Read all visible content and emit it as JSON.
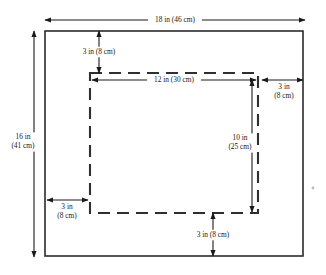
{
  "diagram": {
    "type": "technical-dimension-drawing",
    "units": {
      "primary": "in",
      "secondary": "cm"
    },
    "colors": {
      "background": "#ffffff",
      "outer_rect_stroke": "#2b2b2b",
      "dashed_rect_stroke": "#2f2f2f",
      "dimension_stroke": "#1a1a1a",
      "text": "#1a1a1a"
    },
    "outer_rect": {
      "name": "outer-sheet",
      "x": 45,
      "y": 31,
      "width": 258,
      "height": 225,
      "width_label": "18 in (46 cm)",
      "height_label_line1": "16 in",
      "height_label_line2": "(41 cm)"
    },
    "inner_rect": {
      "name": "inner-dashed-region",
      "x": 90,
      "y": 73,
      "width": 168,
      "height": 140,
      "width_label": "12 in (30 cm)",
      "height_label_line1": "10 in",
      "height_label_line2": "(25 cm)",
      "dash_on": 12,
      "dash_off": 7
    },
    "dimensions": [
      {
        "id": "overall-width",
        "label": "18 in (46 cm)",
        "lines": [
          "18 in (46 cm)"
        ],
        "orientation": "horizontal",
        "x1": 45,
        "y1": 20,
        "x2": 305,
        "y2": 20,
        "text_x": 175,
        "text_y": 20,
        "arrows": "both"
      },
      {
        "id": "overall-height",
        "label": "16 in (41 cm)",
        "lines": [
          "16 in",
          "(41 cm)"
        ],
        "orientation": "vertical",
        "x1": 34,
        "y1": 31,
        "x2": 34,
        "y2": 257,
        "text_x": 23,
        "text_y": 142,
        "arrows": "both"
      },
      {
        "id": "top-margin",
        "label": "3 in (8 cm)",
        "lines": [
          "3 in (8 cm)"
        ],
        "orientation": "vertical",
        "x1": 99,
        "y1": 31,
        "x2": 99,
        "y2": 73,
        "text_x": 99,
        "text_y": 52,
        "arrows": "both"
      },
      {
        "id": "inner-width",
        "label": "12 in (30 cm)",
        "lines": [
          "12 in (30 cm)"
        ],
        "orientation": "horizontal",
        "x1": 92,
        "y1": 80,
        "x2": 256,
        "y2": 80,
        "text_x": 174,
        "text_y": 80,
        "arrows": "both"
      },
      {
        "id": "right-margin",
        "label": "3 in (8 cm)",
        "lines": [
          "3 in",
          "(8 cm)"
        ],
        "orientation": "horizontal",
        "x1": 262,
        "y1": 80,
        "x2": 303,
        "y2": 80,
        "text_x": 284,
        "text_y": 92,
        "arrows": "both"
      },
      {
        "id": "inner-height",
        "label": "10 in (25 cm)",
        "lines": [
          "10 in",
          "(25 cm)"
        ],
        "orientation": "vertical",
        "x1": 252,
        "y1": 80,
        "x2": 252,
        "y2": 212,
        "text_x": 240,
        "text_y": 143,
        "arrows": "both"
      },
      {
        "id": "left-margin",
        "label": "3 in (8 cm)",
        "lines": [
          "3 in",
          "(8 cm)"
        ],
        "orientation": "horizontal",
        "x1": 47,
        "y1": 200,
        "x2": 88,
        "y2": 200,
        "text_x": 67,
        "text_y": 212,
        "arrows": "both"
      },
      {
        "id": "bottom-margin",
        "label": "3 in (8 cm)",
        "lines": [
          "3 in (8 cm)"
        ],
        "orientation": "vertical",
        "x1": 213,
        "y1": 213,
        "x2": 213,
        "y2": 256,
        "text_x": 213,
        "text_y": 235,
        "arrows": "both"
      }
    ]
  }
}
